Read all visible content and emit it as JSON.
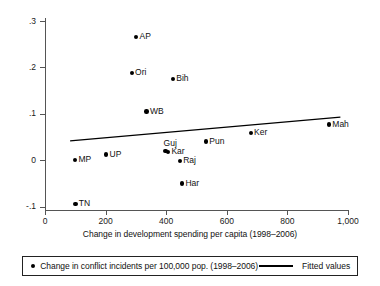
{
  "chart_data": {
    "type": "scatter",
    "title": "",
    "xlabel": "Change in development spending per capita (1998–2006)",
    "ylabel": "",
    "xlim": [
      0,
      1000
    ],
    "ylim": [
      -0.1,
      0.3
    ],
    "grid": false,
    "xticks": [
      0,
      200,
      400,
      600,
      800,
      1000
    ],
    "xticklabels": [
      "0",
      "200",
      "400",
      "600",
      "800",
      "1,000"
    ],
    "yticks": [
      -0.1,
      0,
      0.1,
      0.2,
      0.3
    ],
    "yticklabels": [
      "-.1",
      "0",
      ".1",
      ".2",
      ".3"
    ],
    "points": [
      {
        "label": "AP",
        "x": 301,
        "y": 0.265,
        "label_pos": "right"
      },
      {
        "label": "Ori",
        "x": 286,
        "y": 0.188,
        "label_pos": "right"
      },
      {
        "label": "Bih",
        "x": 422,
        "y": 0.175,
        "label_pos": "right"
      },
      {
        "label": "WB",
        "x": 335,
        "y": 0.105,
        "label_pos": "right"
      },
      {
        "label": "Mah",
        "x": 937,
        "y": 0.077,
        "label_pos": "right"
      },
      {
        "label": "Ker",
        "x": 679,
        "y": 0.058,
        "label_pos": "right"
      },
      {
        "label": "Pun",
        "x": 531,
        "y": 0.04,
        "label_pos": "right"
      },
      {
        "label": "Guj",
        "x": 398,
        "y": 0.02,
        "label_pos": "above"
      },
      {
        "label": "Kar",
        "x": 406,
        "y": 0.018,
        "label_pos": "right"
      },
      {
        "label": "Raj",
        "x": 445,
        "y": -0.002,
        "label_pos": "right"
      },
      {
        "label": "UP",
        "x": 202,
        "y": 0.012,
        "label_pos": "right"
      },
      {
        "label": "MP",
        "x": 99,
        "y": 0.0,
        "label_pos": "right"
      },
      {
        "label": "Har",
        "x": 452,
        "y": -0.05,
        "label_pos": "right"
      },
      {
        "label": "TN",
        "x": 100,
        "y": -0.095,
        "label_pos": "right"
      }
    ],
    "fitted_line": {
      "x0": 83,
      "y0": 0.0415,
      "x1": 975,
      "y1": 0.0925,
      "slope": 5.72e-05,
      "intercept": 0.0368
    },
    "legend": {
      "position": "below-plot",
      "entries": [
        {
          "marker": "dot",
          "label": "Change in conflict incidents per 100,000 pop. (1998–2006)"
        },
        {
          "marker": "line",
          "label": "Fitted values"
        }
      ]
    },
    "colors": {
      "marker": "#000000",
      "line": "#000000",
      "axis": "#555555"
    }
  }
}
